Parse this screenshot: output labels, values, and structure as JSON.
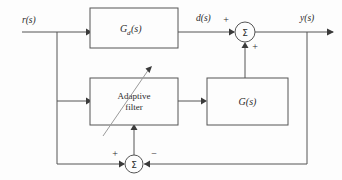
{
  "diagram": {
    "type": "control-system-block-diagram",
    "background_color": "#fdfdfd",
    "line_color": "#555555",
    "text_color": "#2b2b2b",
    "blocks": [
      {
        "id": "gd",
        "label": "G",
        "subscript": "d",
        "suffix": "(s)",
        "x": 90,
        "y": 8,
        "w": 88,
        "h": 40
      },
      {
        "id": "adaptive_filter",
        "label_line1": "Adaptive",
        "label_line2": "filter",
        "x": 90,
        "y": 78,
        "w": 88,
        "h": 47
      },
      {
        "id": "g",
        "label": "G(s)",
        "x": 207,
        "y": 78,
        "w": 81,
        "h": 47
      }
    ],
    "summing_junctions": [
      {
        "id": "top_summer",
        "glyph": "Σ",
        "cx": 245,
        "cy": 32,
        "r": 10,
        "input_signs": [
          {
            "side": "left",
            "sign": "+"
          },
          {
            "side": "bottom",
            "sign": "+"
          }
        ]
      },
      {
        "id": "bottom_summer",
        "glyph": "Σ",
        "cx": 134,
        "cy": 164,
        "r": 9,
        "input_signs": [
          {
            "side": "left",
            "sign": "+"
          },
          {
            "side": "right",
            "sign": "−"
          }
        ]
      }
    ],
    "signals": [
      {
        "id": "input_signal",
        "label": "r(s)",
        "x": 22,
        "y": 23
      },
      {
        "id": "disturbance_signal",
        "label": "d(s)",
        "x": 196,
        "y": 21
      },
      {
        "id": "output_signal",
        "label": "y(s)",
        "x": 300,
        "y": 21
      }
    ],
    "annotations": [
      {
        "id": "adaptation-arrow",
        "description": "diagonal arrow through adaptive filter block"
      }
    ]
  }
}
